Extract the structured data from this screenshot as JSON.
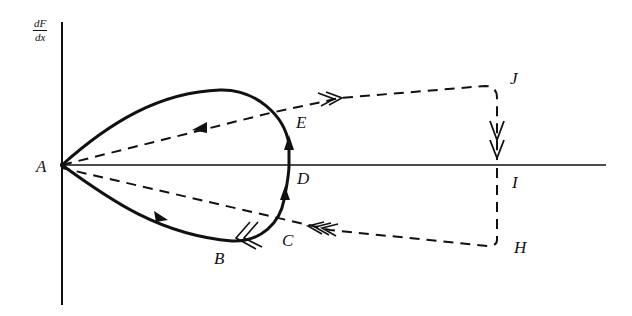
{
  "diagram": {
    "y_axis_label": {
      "numerator": "dF",
      "denominator": "dx"
    },
    "points": {
      "A": "A",
      "B": "B",
      "C": "C",
      "D": "D",
      "E": "E",
      "H": "H",
      "I": "I",
      "J": "J"
    },
    "colors": {
      "ink": "#111111",
      "background": "#ffffff"
    },
    "paths": [
      {
        "name": "solid-loop",
        "style": "solid",
        "route": "A-B-C-D-E-A",
        "arrows": [
          "A→B",
          "C→D",
          "D→E",
          "B double-chevron"
        ]
      },
      {
        "name": "dashed-upper",
        "style": "dashed",
        "route": "A-E-J-I",
        "arrows": [
          "toward A (single)",
          "toward J (double)",
          "toward I (double)"
        ]
      },
      {
        "name": "dashed-lower",
        "style": "dashed",
        "route": "I-H-C-A",
        "arrows": [
          "toward C (triple chevron)"
        ]
      }
    ]
  }
}
